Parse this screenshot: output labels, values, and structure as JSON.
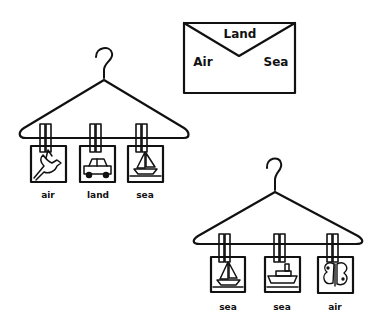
{
  "envelope": {
    "top_label": "Land",
    "left_label": "Air",
    "right_label": "Sea"
  },
  "hangers": [
    {
      "cards": [
        {
          "icon": "bird-icon",
          "label": "air"
        },
        {
          "icon": "car-icon",
          "label": "land"
        },
        {
          "icon": "sailboat-icon",
          "label": "sea"
        }
      ]
    },
    {
      "cards": [
        {
          "icon": "sailboat-icon",
          "label": "sea"
        },
        {
          "icon": "steamship-icon",
          "label": "sea"
        },
        {
          "icon": "butterfly-icon",
          "label": "air"
        }
      ]
    }
  ],
  "colors": {
    "ink": "#111111",
    "background": "#ffffff"
  }
}
